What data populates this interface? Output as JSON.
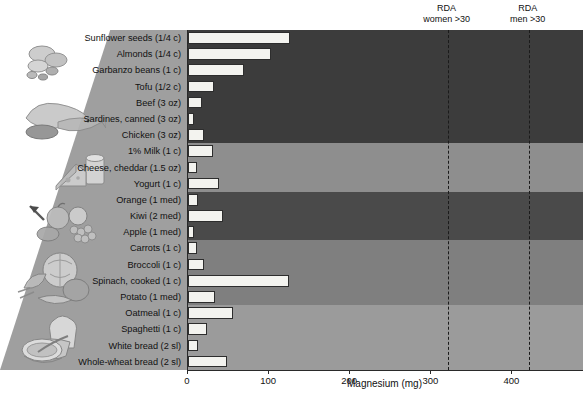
{
  "chart_data": {
    "type": "bar",
    "orientation": "horizontal",
    "title": "",
    "xlabel": "Magnesium (mg)",
    "ylabel": "",
    "xlim": [
      0,
      487
    ],
    "xticks": [
      0,
      100,
      200,
      300,
      400
    ],
    "grid": false,
    "legend": "none",
    "categories": [
      "Sunflower seeds (1/4 c)",
      "Almonds  (1/4 c)",
      "Garbanzo beans (1 c)",
      "Tofu (1/2 c)",
      "Beef (3 oz)",
      "Sardines, canned (3 oz)",
      "Chicken (3 oz)",
      "1% Milk (1 c)",
      "Cheese, cheddar (1.5 oz)",
      "Yogurt (1 c)",
      "Orange (1 med)",
      "Kiwi (2 med)",
      "Apple (1 med)",
      "Carrots (1 c)",
      "Broccoli (1 c)",
      "Spinach, cooked (1 c)",
      "Potato (1 med)",
      "Oatmeal (1 c)",
      "Spaghetti (1 c)",
      "White bread (2 sl)",
      "Whole-wheat bread (2 sl)"
    ],
    "values": [
      126,
      102,
      69,
      32,
      17,
      8,
      20,
      31,
      11,
      38,
      12,
      43,
      7,
      11,
      20,
      124,
      33,
      56,
      24,
      12,
      48
    ],
    "annotations": [
      {
        "name": "RDA women >30",
        "line1": "RDA",
        "line2": "women >30",
        "value": 320
      },
      {
        "name": "RDA men >30",
        "line1": "RDA",
        "line2": "men >30",
        "value": 420
      }
    ],
    "groups": [
      {
        "name": "protein",
        "start": 0,
        "end": 7,
        "color": "#3c3c3c"
      },
      {
        "name": "dairy",
        "start": 7,
        "end": 10,
        "color": "#8e8e8e"
      },
      {
        "name": "fruit",
        "start": 10,
        "end": 13,
        "color": "#4a4a4a"
      },
      {
        "name": "vegetables",
        "start": 13,
        "end": 17,
        "color": "#7f7f7f"
      },
      {
        "name": "grains",
        "start": 17,
        "end": 21,
        "color": "#9b9b9b"
      }
    ]
  },
  "colors": {
    "bar_fill": "#f3f3ef",
    "bar_stroke": "#2d2d2d",
    "axis": "#2a2a2a",
    "wedge": "#9a9a9a",
    "text": "#111111"
  },
  "illustrations": [
    {
      "name": "nuts-and-seeds-illustration"
    },
    {
      "name": "meat-poultry-fish-illustration"
    },
    {
      "name": "cheese-and-dairy-illustration"
    },
    {
      "name": "fruit-basket-illustration"
    },
    {
      "name": "vegetables-illustration"
    },
    {
      "name": "bread-and-cereal-illustration"
    }
  ]
}
